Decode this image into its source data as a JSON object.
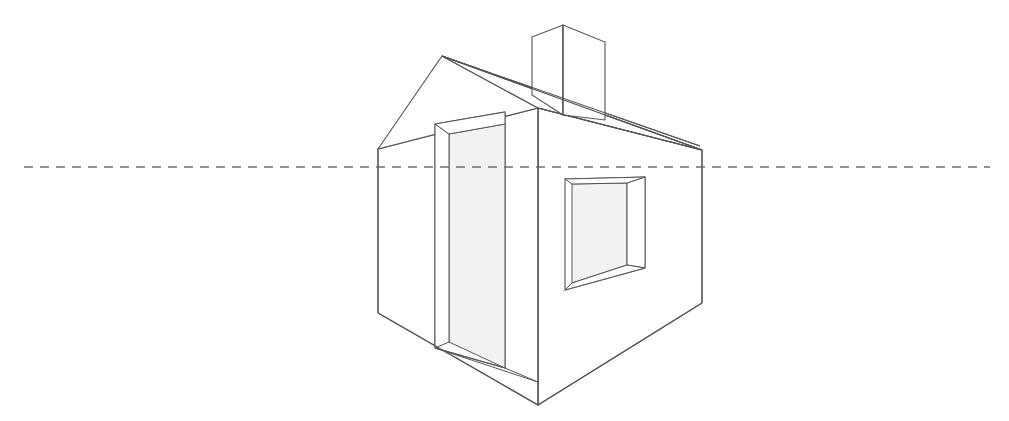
{
  "canvas": {
    "width": 1009,
    "height": 421,
    "background": "#ffffff",
    "title": "Two-point perspective house drawing"
  },
  "style": {
    "line_color": "#555555",
    "line_color_dark": "#4a4a4a",
    "line_width": 1.1,
    "horizon_color": "#6f6f6f",
    "horizon_dash": "9 7",
    "horizon_width": 1.6,
    "panel_fill": "#f2f2f2",
    "panel_fill_light": "#f7f7f7",
    "reveal_fill": "#ffffff"
  },
  "chart_data": {
    "type": "diagram",
    "title": "Two-point perspective house drawing",
    "subtitle": "Line drawing of a simple gabled house with chimney, recessed door and recessed window, crossed by a dashed eye-level horizon line",
    "xlabel": "",
    "ylabel": "",
    "grid": false,
    "legend": null,
    "annotations": [
      {
        "name": "horizon-line",
        "text": "eye level / horizon",
        "y": 167
      }
    ],
    "objects": [
      {
        "name": "horizon-line",
        "kind": "dashed-line",
        "points": [
          [
            24,
            167
          ],
          [
            990,
            167
          ]
        ]
      },
      {
        "name": "front-wall",
        "kind": "polygon",
        "points": [
          [
            538,
            108
          ],
          [
            702,
            150
          ],
          [
            702,
            303
          ],
          [
            538,
            405
          ]
        ]
      },
      {
        "name": "side-wall",
        "kind": "polygon",
        "points": [
          [
            378,
            149
          ],
          [
            538,
            108
          ],
          [
            538,
            405
          ],
          [
            378,
            313
          ]
        ]
      },
      {
        "name": "gable-triangle",
        "kind": "polygon",
        "points": [
          [
            378,
            149
          ],
          [
            442,
            56
          ],
          [
            538,
            108
          ]
        ]
      },
      {
        "name": "roof-front-plane",
        "kind": "polygon",
        "points": [
          [
            442,
            56
          ],
          [
            702,
            150
          ],
          [
            538,
            108
          ]
        ]
      },
      {
        "name": "roof-ridge-line",
        "kind": "line",
        "points": [
          [
            442,
            56
          ],
          [
            702,
            150
          ]
        ]
      },
      {
        "name": "roof-back-slope",
        "kind": "line",
        "points": [
          [
            442,
            56
          ],
          [
            700,
            147
          ]
        ]
      },
      {
        "name": "chimney",
        "kind": "box",
        "points": [
          [
            532,
            37
          ],
          [
            563,
            25
          ],
          [
            605,
            42
          ],
          [
            605,
            120
          ],
          [
            563,
            115
          ],
          [
            532,
            95
          ]
        ]
      },
      {
        "name": "window-opening",
        "kind": "recessed-rect",
        "outer": [
          [
            565,
            179
          ],
          [
            645,
            177
          ],
          [
            645,
            268
          ],
          [
            565,
            290
          ]
        ],
        "inner": [
          [
            578,
            186
          ],
          [
            632,
            184
          ],
          [
            632,
            262
          ],
          [
            578,
            281
          ]
        ]
      },
      {
        "name": "door-opening",
        "kind": "recessed-rect",
        "outer": [
          [
            435,
            124
          ],
          [
            505,
            112
          ],
          [
            505,
            368
          ],
          [
            435,
            348
          ]
        ],
        "inner": [
          [
            447,
            133
          ],
          [
            496,
            122
          ],
          [
            496,
            360
          ],
          [
            447,
            342
          ]
        ]
      }
    ]
  },
  "labels": {
    "alt": "Perspective construction drawing of a house"
  }
}
